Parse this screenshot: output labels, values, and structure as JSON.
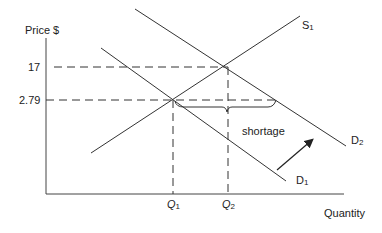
{
  "diagram": {
    "type": "supply-demand",
    "y_axis_label": "Price $",
    "x_axis_label": "Quantity",
    "price_ticks": [
      "17",
      "2.79"
    ],
    "quantity_ticks": [
      {
        "main": "Q",
        "sub": "1"
      },
      {
        "main": "Q",
        "sub": "2"
      }
    ],
    "curves": {
      "supply": {
        "main": "S",
        "sub": "1"
      },
      "demand_initial": {
        "main": "D",
        "sub": "1"
      },
      "demand_shifted": {
        "main": "D",
        "sub": "2"
      }
    },
    "annotation": "shortage",
    "shift_direction": "demand shifts right (D1 to D2)",
    "colors": {
      "line": "#333333",
      "text": "#222222",
      "background": "#ffffff"
    }
  }
}
